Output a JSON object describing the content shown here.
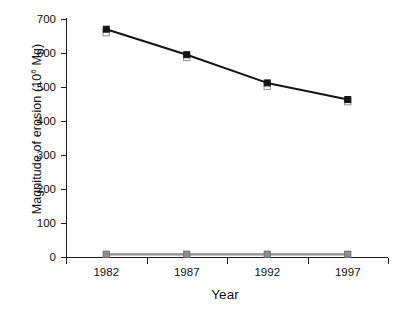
{
  "chart_data": {
    "type": "line",
    "title": "",
    "xlabel": "Year",
    "ylabel": "Magnitude of erosion (10⁶ Mg)",
    "ylabel_text": "Magnitude of erosion (10",
    "ylabel_exp": "6",
    "ylabel_tail": " Mg)",
    "categories": [
      "1982",
      "1987",
      "1992",
      "1997"
    ],
    "x": [
      1982,
      1987,
      1992,
      1997
    ],
    "ylim": [
      0,
      700
    ],
    "yticks": [
      0,
      100,
      200,
      300,
      400,
      500,
      600,
      700
    ],
    "ytick_labels": [
      "0",
      "100",
      "200",
      "300",
      "400",
      "500",
      "600",
      "700"
    ],
    "grid": false,
    "legend": "none",
    "series": [
      {
        "name": "Total erosion (filled square)",
        "marker": "filled-square",
        "color": "#141414",
        "line_color": "#141414",
        "values": [
          670,
          595,
          512,
          463
        ]
      },
      {
        "name": "Sheet and rill erosion (open square)",
        "marker": "open-square",
        "color": "#ffffff",
        "line_color": "#141414",
        "values": [
          660,
          587,
          502,
          457
        ]
      },
      {
        "name": "Wind erosion near zero (gray square)",
        "marker": "gray-square",
        "color": "#8f8f8f",
        "line_color": "#8f8f8f",
        "values": [
          8,
          8,
          8,
          8
        ]
      }
    ]
  },
  "axes": {
    "y_tick_count": 8,
    "x_tick_count": 5
  }
}
